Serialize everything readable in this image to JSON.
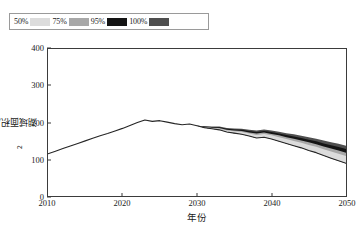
{
  "legend": {
    "position": "top-left",
    "entries": [
      {
        "label": "50%",
        "color": "#dcdcdc"
      },
      {
        "label": "75%",
        "color": "#a8a8a8"
      },
      {
        "label": "95%",
        "color": "#141414"
      },
      {
        "label": "100%",
        "color": "#4f4f4f"
      }
    ]
  },
  "axes": {
    "y_title_main": "湖域面积/hm",
    "y_title_sup": "2",
    "x_title": "年份",
    "y_ticks": [
      "0",
      "100",
      "200",
      "300",
      "400"
    ],
    "x_ticks": [
      "2010",
      "2020",
      "2030",
      "2040",
      "2050"
    ]
  },
  "chart_data": {
    "type": "line",
    "title": "",
    "subtitle": "",
    "xlabel": "年份",
    "ylabel": "湖域面积/hm²",
    "xlim": [
      2010,
      2050
    ],
    "ylim": [
      0,
      400
    ],
    "ytick_values": [
      0,
      100,
      200,
      300,
      400
    ],
    "xtick_values": [
      2010,
      2020,
      2030,
      2040,
      2050
    ],
    "grid": false,
    "legend_entries": [
      "50%",
      "75%",
      "95%",
      "100%"
    ],
    "x": [
      2010,
      2011,
      2012,
      2013,
      2014,
      2015,
      2016,
      2017,
      2018,
      2019,
      2020,
      2021,
      2022,
      2023,
      2024,
      2025,
      2026,
      2027,
      2028,
      2029,
      2030,
      2031,
      2032,
      2033,
      2034,
      2035,
      2036,
      2037,
      2038,
      2039,
      2040,
      2041,
      2042,
      2043,
      2044,
      2045,
      2046,
      2047,
      2048,
      2049,
      2050
    ],
    "series": [
      {
        "name": "median",
        "values": [
          115,
          122,
          129,
          136,
          143,
          150,
          157,
          164,
          170,
          177,
          184,
          192,
          200,
          207,
          203,
          205,
          201,
          197,
          194,
          196,
          191,
          186,
          183,
          180,
          174,
          171,
          168,
          163,
          158,
          160,
          155,
          149,
          143,
          137,
          131,
          124,
          118,
          110,
          103,
          96,
          89
        ]
      },
      {
        "name": "50%-upper",
        "values": [
          115,
          122,
          129,
          136,
          143,
          150,
          157,
          164,
          170,
          177,
          184,
          192,
          200,
          207,
          203,
          205,
          201,
          197,
          194,
          196,
          191,
          187,
          185,
          183,
          178,
          176,
          174,
          170,
          166,
          169,
          165,
          160,
          155,
          150,
          145,
          139,
          134,
          127,
          121,
          115,
          109
        ]
      },
      {
        "name": "75%-upper",
        "values": [
          115,
          122,
          129,
          136,
          143,
          150,
          157,
          164,
          170,
          177,
          184,
          192,
          200,
          207,
          203,
          205,
          201,
          197,
          194,
          196,
          191,
          188,
          186,
          185,
          180,
          178,
          177,
          173,
          170,
          173,
          169,
          165,
          160,
          156,
          151,
          146,
          141,
          135,
          129,
          124,
          118
        ]
      },
      {
        "name": "95%-upper",
        "values": [
          115,
          122,
          129,
          136,
          143,
          150,
          157,
          164,
          170,
          177,
          184,
          192,
          200,
          207,
          203,
          205,
          201,
          197,
          194,
          196,
          191,
          189,
          188,
          187,
          183,
          181,
          180,
          177,
          174,
          177,
          174,
          170,
          166,
          162,
          158,
          153,
          149,
          143,
          138,
          133,
          128
        ]
      },
      {
        "name": "100%-upper",
        "values": [
          115,
          122,
          129,
          136,
          143,
          150,
          157,
          164,
          170,
          177,
          184,
          192,
          200,
          207,
          203,
          205,
          201,
          197,
          194,
          196,
          191,
          190,
          189,
          189,
          185,
          184,
          183,
          180,
          178,
          181,
          178,
          175,
          171,
          168,
          164,
          160,
          156,
          151,
          146,
          142,
          137
        ]
      }
    ]
  }
}
